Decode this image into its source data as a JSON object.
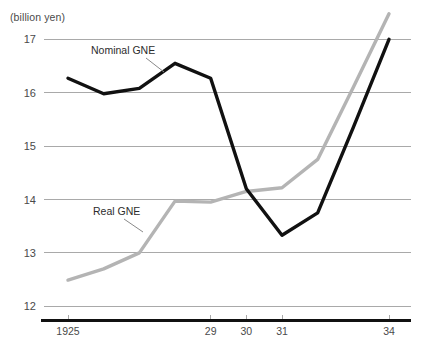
{
  "axis": {
    "unit_label": "(billion yen)",
    "y_ticks": [
      "17",
      "16",
      "15",
      "14",
      "13",
      "12"
    ],
    "x_ticks": [
      "1925",
      "29",
      "30",
      "31",
      "34"
    ]
  },
  "labels": {
    "nominal": "Nominal GNE",
    "real": "Real GNE"
  },
  "colors": {
    "nominal_line": "#111111",
    "real_line": "#b4b4b4",
    "gridline": "#a9a9a9",
    "axis": "#111111",
    "text": "#4a4a4a"
  },
  "chart_data": {
    "type": "line",
    "title": "",
    "subtitle": "",
    "xlabel": "",
    "ylabel": "(billion yen)",
    "ylim": [
      11.6,
      17.6
    ],
    "xlim": [
      1925,
      1934
    ],
    "grid": true,
    "legend": "inline-annotations",
    "y_tick_values": [
      17,
      16,
      15,
      14,
      13,
      12
    ],
    "x_tick_values": [
      1925,
      1929,
      1930,
      1931,
      1934
    ],
    "x_tick_labels": [
      "1925",
      "29",
      "30",
      "31",
      "34"
    ],
    "x": [
      1925,
      1926,
      1927,
      1928,
      1929,
      1930,
      1931,
      1932,
      1933,
      1934
    ],
    "series": [
      {
        "name": "Nominal GNE",
        "color": "#111111",
        "values": [
          16.27,
          15.98,
          16.08,
          16.55,
          16.27,
          14.2,
          13.33,
          13.75,
          15.35,
          17.0
        ]
      },
      {
        "name": "Real GNE",
        "color": "#b4b4b4",
        "values": [
          12.49,
          12.7,
          13.0,
          13.97,
          13.95,
          14.15,
          14.22,
          14.75,
          16.1,
          17.48
        ]
      }
    ]
  }
}
